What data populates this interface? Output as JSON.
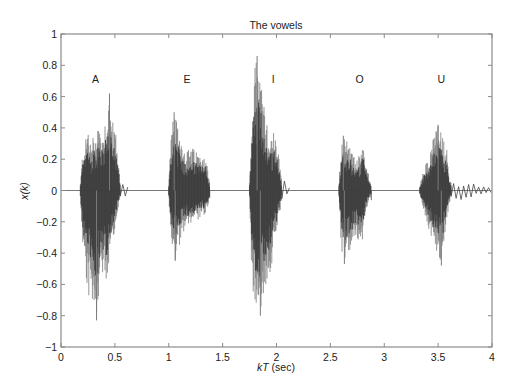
{
  "chart_data": {
    "type": "line",
    "title": "The vowels",
    "xlabel": "kT (sec)",
    "xlabel_parts": {
      "italic": "kT",
      "normal": " (sec)"
    },
    "ylabel": "x(k)",
    "xlim": [
      0,
      4
    ],
    "ylim": [
      -1,
      1
    ],
    "xticks": [
      0,
      0.5,
      1,
      1.5,
      2,
      2.5,
      3,
      3.5,
      4
    ],
    "xtick_labels": [
      "0",
      "0.5",
      "1",
      "1.5",
      "2",
      "2.5",
      "3",
      "3.5",
      "4"
    ],
    "yticks": [
      -1,
      -0.8,
      -0.6,
      -0.4,
      -0.2,
      0,
      0.2,
      0.4,
      0.6,
      0.8,
      1
    ],
    "ytick_labels": [
      "−1",
      "−0.8",
      "−0.6",
      "−0.4",
      "−0.2",
      "0",
      "0.2",
      "0.4",
      "0.6",
      "0.8",
      "1"
    ],
    "grid": false,
    "legend": null,
    "annotations": [
      {
        "text": "A",
        "x": 0.32,
        "y": 0.71
      },
      {
        "text": "E",
        "x": 1.17,
        "y": 0.71
      },
      {
        "text": "I",
        "x": 1.97,
        "y": 0.71
      },
      {
        "text": "O",
        "x": 2.77,
        "y": 0.71
      },
      {
        "text": "U",
        "x": 3.53,
        "y": 0.71
      }
    ],
    "series": [
      {
        "name": "A",
        "t_start": 0.18,
        "t_end": 0.55,
        "tail_end": 0.62,
        "max_peak": 0.62,
        "max_peak_t": 0.45,
        "min_peak": -0.83,
        "min_peak_t": 0.33,
        "upper_envelope": [
          [
            0.18,
            0.05
          ],
          [
            0.2,
            0.25
          ],
          [
            0.23,
            0.33
          ],
          [
            0.25,
            0.42
          ],
          [
            0.28,
            0.3
          ],
          [
            0.3,
            0.36
          ],
          [
            0.33,
            0.38
          ],
          [
            0.35,
            0.48
          ],
          [
            0.37,
            0.35
          ],
          [
            0.4,
            0.42
          ],
          [
            0.43,
            0.55
          ],
          [
            0.45,
            0.62
          ],
          [
            0.47,
            0.45
          ],
          [
            0.5,
            0.42
          ],
          [
            0.52,
            0.3
          ],
          [
            0.55,
            0.05
          ]
        ],
        "lower_envelope": [
          [
            0.18,
            -0.05
          ],
          [
            0.2,
            -0.35
          ],
          [
            0.23,
            -0.55
          ],
          [
            0.25,
            -0.7
          ],
          [
            0.28,
            -0.65
          ],
          [
            0.3,
            -0.75
          ],
          [
            0.33,
            -0.83
          ],
          [
            0.35,
            -0.7
          ],
          [
            0.37,
            -0.55
          ],
          [
            0.4,
            -0.58
          ],
          [
            0.43,
            -0.6
          ],
          [
            0.45,
            -0.5
          ],
          [
            0.47,
            -0.35
          ],
          [
            0.5,
            -0.25
          ],
          [
            0.52,
            -0.15
          ],
          [
            0.55,
            -0.05
          ]
        ]
      },
      {
        "name": "E",
        "t_start": 1.0,
        "t_end": 1.38,
        "tail_end": 1.4,
        "max_peak": 0.5,
        "max_peak_t": 1.05,
        "min_peak": -0.45,
        "min_peak_t": 1.06,
        "upper_envelope": [
          [
            1.0,
            0.05
          ],
          [
            1.02,
            0.35
          ],
          [
            1.05,
            0.5
          ],
          [
            1.08,
            0.42
          ],
          [
            1.1,
            0.38
          ],
          [
            1.13,
            0.3
          ],
          [
            1.16,
            0.25
          ],
          [
            1.2,
            0.28
          ],
          [
            1.25,
            0.26
          ],
          [
            1.3,
            0.22
          ],
          [
            1.33,
            0.25
          ],
          [
            1.35,
            0.2
          ],
          [
            1.38,
            0.05
          ]
        ],
        "lower_envelope": [
          [
            1.0,
            -0.05
          ],
          [
            1.02,
            -0.3
          ],
          [
            1.05,
            -0.42
          ],
          [
            1.06,
            -0.45
          ],
          [
            1.08,
            -0.38
          ],
          [
            1.1,
            -0.35
          ],
          [
            1.13,
            -0.28
          ],
          [
            1.16,
            -0.25
          ],
          [
            1.2,
            -0.22
          ],
          [
            1.25,
            -0.2
          ],
          [
            1.3,
            -0.18
          ],
          [
            1.35,
            -0.15
          ],
          [
            1.38,
            -0.05
          ]
        ]
      },
      {
        "name": "I",
        "t_start": 1.75,
        "t_end": 2.05,
        "tail_end": 2.12,
        "max_peak": 0.86,
        "max_peak_t": 1.82,
        "min_peak": -0.8,
        "min_peak_t": 1.85,
        "upper_envelope": [
          [
            1.75,
            0.05
          ],
          [
            1.77,
            0.5
          ],
          [
            1.79,
            0.75
          ],
          [
            1.82,
            0.86
          ],
          [
            1.84,
            0.8
          ],
          [
            1.86,
            0.72
          ],
          [
            1.88,
            0.6
          ],
          [
            1.9,
            0.45
          ],
          [
            1.93,
            0.38
          ],
          [
            1.96,
            0.35
          ],
          [
            1.98,
            0.42
          ],
          [
            2.0,
            0.32
          ],
          [
            2.03,
            0.18
          ],
          [
            2.05,
            0.05
          ]
        ],
        "lower_envelope": [
          [
            1.75,
            -0.05
          ],
          [
            1.77,
            -0.55
          ],
          [
            1.79,
            -0.72
          ],
          [
            1.82,
            -0.75
          ],
          [
            1.85,
            -0.8
          ],
          [
            1.87,
            -0.7
          ],
          [
            1.9,
            -0.62
          ],
          [
            1.93,
            -0.55
          ],
          [
            1.96,
            -0.48
          ],
          [
            1.98,
            -0.35
          ],
          [
            2.0,
            -0.3
          ],
          [
            2.03,
            -0.15
          ],
          [
            2.05,
            -0.05
          ]
        ]
      },
      {
        "name": "O",
        "t_start": 2.58,
        "t_end": 2.88,
        "tail_end": 2.9,
        "max_peak": 0.35,
        "max_peak_t": 2.62,
        "min_peak": -0.47,
        "min_peak_t": 2.63,
        "upper_envelope": [
          [
            2.58,
            0.05
          ],
          [
            2.6,
            0.32
          ],
          [
            2.62,
            0.35
          ],
          [
            2.65,
            0.33
          ],
          [
            2.68,
            0.3
          ],
          [
            2.72,
            0.22
          ],
          [
            2.75,
            0.2
          ],
          [
            2.78,
            0.25
          ],
          [
            2.8,
            0.33
          ],
          [
            2.82,
            0.22
          ],
          [
            2.85,
            0.12
          ],
          [
            2.88,
            0.03
          ]
        ],
        "lower_envelope": [
          [
            2.58,
            -0.05
          ],
          [
            2.6,
            -0.4
          ],
          [
            2.63,
            -0.47
          ],
          [
            2.66,
            -0.42
          ],
          [
            2.69,
            -0.38
          ],
          [
            2.72,
            -0.35
          ],
          [
            2.75,
            -0.32
          ],
          [
            2.78,
            -0.3
          ],
          [
            2.8,
            -0.32
          ],
          [
            2.82,
            -0.2
          ],
          [
            2.85,
            -0.08
          ],
          [
            2.88,
            -0.03
          ]
        ]
      },
      {
        "name": "U",
        "t_start": 3.33,
        "t_end": 3.62,
        "tail_end": 4.0,
        "max_peak": 0.42,
        "max_peak_t": 3.5,
        "min_peak": -0.48,
        "min_peak_t": 3.53,
        "upper_envelope": [
          [
            3.33,
            0.03
          ],
          [
            3.36,
            0.12
          ],
          [
            3.4,
            0.2
          ],
          [
            3.44,
            0.3
          ],
          [
            3.48,
            0.4
          ],
          [
            3.5,
            0.42
          ],
          [
            3.53,
            0.38
          ],
          [
            3.56,
            0.3
          ],
          [
            3.59,
            0.25
          ],
          [
            3.6,
            0.1
          ],
          [
            3.62,
            0.05
          ]
        ],
        "lower_envelope": [
          [
            3.33,
            -0.03
          ],
          [
            3.36,
            -0.12
          ],
          [
            3.4,
            -0.22
          ],
          [
            3.44,
            -0.32
          ],
          [
            3.48,
            -0.4
          ],
          [
            3.53,
            -0.48
          ],
          [
            3.55,
            -0.38
          ],
          [
            3.58,
            -0.2
          ],
          [
            3.6,
            -0.1
          ],
          [
            3.62,
            -0.04
          ]
        ]
      }
    ],
    "colors": {
      "axis": "#8a8a8a",
      "waveform_dark": "#3a3a3a",
      "waveform_light": "#7a7a7a",
      "text": "#222222"
    }
  }
}
